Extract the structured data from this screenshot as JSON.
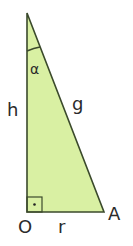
{
  "diagram": {
    "type": "right-triangle",
    "colors": {
      "fill": "#d9f0a3",
      "stroke": "#3b4a2c",
      "label": "#2b2b2b"
    },
    "vertices": {
      "apex": {
        "x": 27,
        "y": 13
      },
      "origin": {
        "x": 27,
        "y": 212,
        "label": "O"
      },
      "a": {
        "x": 104,
        "y": 212,
        "label": "A"
      }
    },
    "labels": {
      "height": "h",
      "hypotenuse": "g",
      "base": "r",
      "angle": "α",
      "origin": "O",
      "point_a": "A"
    },
    "right_angle_marker": "·"
  }
}
